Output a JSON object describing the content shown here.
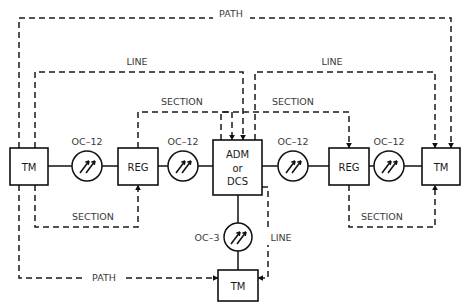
{
  "diagram": {
    "background_color": "#ffffff",
    "line_color": "#111111",
    "text_color": "#1a1a1a"
  },
  "nodes": [
    {
      "id": "tm-left",
      "label": "TM",
      "x": 10,
      "y": 148,
      "w": 38,
      "h": 37
    },
    {
      "id": "reg-left",
      "label": "REG",
      "x": 118,
      "y": 148,
      "w": 40,
      "h": 37
    },
    {
      "id": "adm",
      "label": "ADM\nor\nDCS",
      "label_lines": [
        "ADM",
        "or",
        "DCS"
      ],
      "x": 213,
      "y": 140,
      "w": 49,
      "h": 55
    },
    {
      "id": "reg-right",
      "label": "REG",
      "x": 329,
      "y": 148,
      "w": 40,
      "h": 37
    },
    {
      "id": "tm-right",
      "label": "TM",
      "x": 422,
      "y": 148,
      "w": 38,
      "h": 37
    },
    {
      "id": "tm-bottom",
      "label": "TM",
      "x": 218,
      "y": 270,
      "w": 40,
      "h": 31
    }
  ],
  "repeaters": [
    {
      "id": "amp-1",
      "rate_label": "OC–12",
      "cx": 87,
      "cy": 166,
      "r": 15,
      "orientation": "horizontal",
      "label_x": 87,
      "label_y": 142
    },
    {
      "id": "amp-2",
      "rate_label": "OC–12",
      "cx": 183,
      "cy": 166,
      "r": 15,
      "orientation": "horizontal",
      "label_x": 183,
      "label_y": 142
    },
    {
      "id": "amp-3",
      "rate_label": "OC–12",
      "cx": 293,
      "cy": 166,
      "r": 15,
      "orientation": "horizontal",
      "label_x": 293,
      "label_y": 142
    },
    {
      "id": "amp-4",
      "rate_label": "OC–12",
      "cx": 389,
      "cy": 166,
      "r": 15,
      "orientation": "horizontal",
      "label_x": 389,
      "label_y": 142
    },
    {
      "id": "amp-5",
      "rate_label": "OC–3",
      "cx": 238,
      "cy": 237,
      "r": 14,
      "orientation": "vertical",
      "label_x": 207,
      "label_y": 238
    }
  ],
  "spans": [
    {
      "id": "path-top",
      "label": "PATH",
      "label_x": 231,
      "label_y": 14
    },
    {
      "id": "line-left",
      "label": "LINE",
      "label_x": 137,
      "label_y": 62
    },
    {
      "id": "line-right",
      "label": "LINE",
      "label_x": 332,
      "label_y": 62
    },
    {
      "id": "section-top-left",
      "label": "SECTION",
      "label_x": 182,
      "label_y": 102
    },
    {
      "id": "section-top-right",
      "label": "SECTION",
      "label_x": 293,
      "label_y": 102
    },
    {
      "id": "section-bottom-left",
      "label": "SECTION",
      "label_x": 93,
      "label_y": 217
    },
    {
      "id": "section-bottom-right",
      "label": "SECTION",
      "label_x": 382,
      "label_y": 217
    },
    {
      "id": "path-bottom",
      "label": "PATH",
      "label_x": 104,
      "label_y": 278
    },
    {
      "id": "line-bottom",
      "label": "LINE",
      "label_x": 281,
      "label_y": 238
    }
  ]
}
